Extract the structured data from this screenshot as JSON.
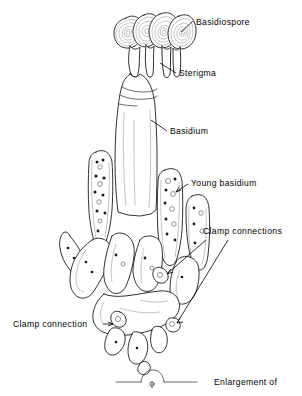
{
  "figure": {
    "background_color": "#ffffff",
    "ink_color": "#1a1a1a",
    "width": 302,
    "height": 396
  },
  "labels": [
    {
      "id": "basidiospore",
      "text": "Basidiospore",
      "x": 196,
      "y": 25
    },
    {
      "id": "sterigma",
      "text": "Sterigma",
      "x": 179,
      "y": 76
    },
    {
      "id": "basidium",
      "text": "Basidium",
      "x": 170,
      "y": 134
    },
    {
      "id": "young-basidium",
      "text": "Young basidium",
      "x": 191,
      "y": 186
    },
    {
      "id": "clamp-connections",
      "text": "Clamp connections",
      "x": 203,
      "y": 234
    },
    {
      "id": "clamp-connection",
      "text": "Clamp connection",
      "x": 13,
      "y": 327
    },
    {
      "id": "enlargement-of",
      "text": "Enlargement of",
      "x": 214,
      "y": 385
    }
  ],
  "structures": {
    "basidiospore_count": 4,
    "sterigma_count": 4,
    "young_basidium_count": 4,
    "enlargement_detail": "clamp-connection-enlargement"
  },
  "icons": {
    "leader_line": "leader-line",
    "arrowhead": "arrowhead-icon"
  }
}
